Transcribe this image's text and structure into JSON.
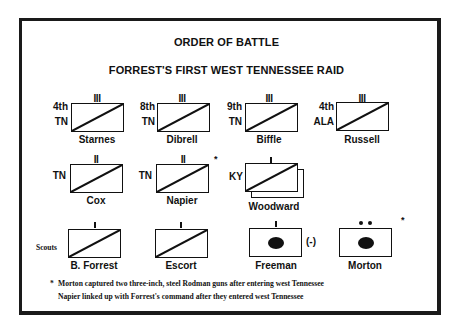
{
  "title": "ORDER OF BATTLE",
  "subtitle": "FORREST'S FIRST WEST TENNESSEE RAID",
  "units": [
    {
      "name": "Starnes",
      "number": "4th",
      "state": "TN",
      "size": "III",
      "type": "cavalry"
    },
    {
      "name": "Dibrell",
      "number": "8th",
      "state": "TN",
      "size": "III",
      "type": "cavalry"
    },
    {
      "name": "Biffle",
      "number": "9th",
      "state": "TN",
      "size": "III",
      "type": "cavalry"
    },
    {
      "name": "Russell",
      "number": "4th",
      "state": "ALA",
      "size": "III",
      "type": "cavalry"
    },
    {
      "name": "Cox",
      "number": "",
      "state": "TN",
      "size": "II",
      "type": "cavalry"
    },
    {
      "name": "Napier",
      "number": "",
      "state": "TN",
      "size": "II",
      "type": "cavalry",
      "footnote": "*"
    },
    {
      "name": "Woodward",
      "number": "",
      "state": "KY",
      "size": "I",
      "type": "cavalry-multiple"
    },
    {
      "name": "B. Forrest",
      "label": "Scouts",
      "size": "I",
      "type": "cavalry"
    },
    {
      "name": "Escort",
      "size": "I",
      "type": "cavalry"
    },
    {
      "name": "Freeman",
      "size": "I",
      "type": "artillery",
      "suffix": "(-)"
    },
    {
      "name": "Morton",
      "size": "••",
      "type": "artillery",
      "footnote": "*"
    }
  ],
  "notes": {
    "bullet": "*",
    "line1": "Morton captured two three-inch, steel Rodman guns after entering west Tennessee",
    "line2": "Napier linked up with Forrest's command after they entered west Tennessee"
  }
}
